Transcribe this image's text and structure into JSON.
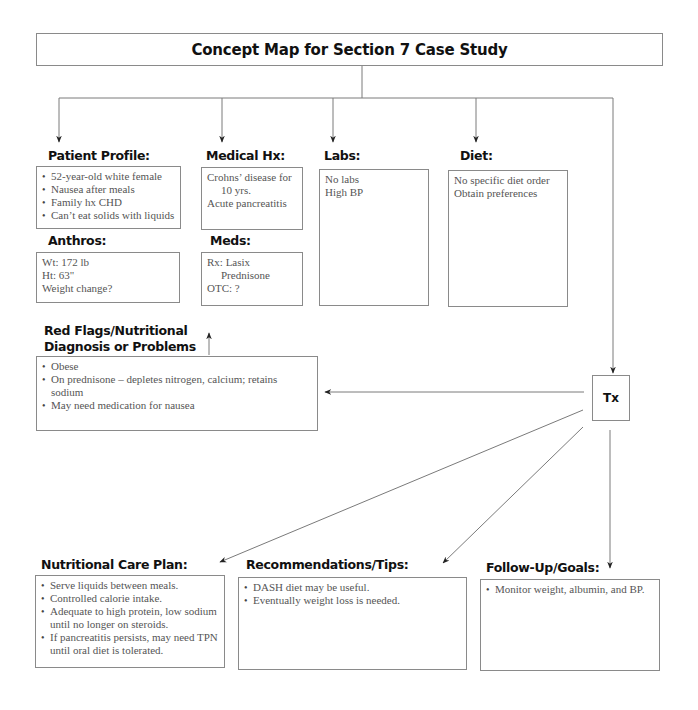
{
  "title": "Concept Map for Section 7 Case Study",
  "colors": {
    "line": "#7a7a7a",
    "heading": "#111111",
    "text": "#555555"
  },
  "nodes": {
    "patient_profile": {
      "heading": "Patient Profile:",
      "items": [
        "52-year-old white female",
        "Nausea after meals",
        "Family hx CHD",
        "Can’t eat solids with liquids"
      ]
    },
    "medical_hx": {
      "heading": "Medical Hx:",
      "lines": [
        "Crohns’ disease for",
        "10 yrs.",
        "Acute pancreatitis"
      ]
    },
    "labs": {
      "heading": "Labs:",
      "lines": [
        "No labs",
        "High BP"
      ]
    },
    "diet": {
      "heading": "Diet:",
      "lines": [
        "No specific diet order",
        "Obtain preferences"
      ]
    },
    "anthros": {
      "heading": "Anthros:",
      "lines": [
        "Wt: 172 lb",
        "Ht: 63\"",
        "Weight change?"
      ]
    },
    "meds": {
      "heading": "Meds:",
      "lines": [
        "Rx: Lasix",
        "Prednisone",
        "OTC: ?"
      ]
    },
    "red_flags": {
      "heading_line1": "Red Flags/Nutritional",
      "heading_line2": "Diagnosis or Problems",
      "items": [
        "Obese",
        "On prednisone – depletes nitrogen, calcium; retains sodium",
        "May need medication for nausea"
      ]
    },
    "tx": {
      "label": "Tx"
    },
    "care_plan": {
      "heading": "Nutritional Care Plan:",
      "items": [
        [
          "Serve liquids between meals."
        ],
        [
          "Controlled calorie intake."
        ],
        [
          "Adequate to high protein, low sodium",
          "until no longer on steroids."
        ],
        [
          "If pancreatitis persists, may need TPN",
          "until oral diet is tolerated."
        ]
      ]
    },
    "recommendations": {
      "heading": "Recommendations/Tips:",
      "items": [
        "DASH diet may be useful.",
        "Eventually weight loss is needed."
      ]
    },
    "follow_up": {
      "heading": "Follow-Up/Goals:",
      "items": [
        "Monitor weight, albumin, and BP."
      ]
    }
  }
}
